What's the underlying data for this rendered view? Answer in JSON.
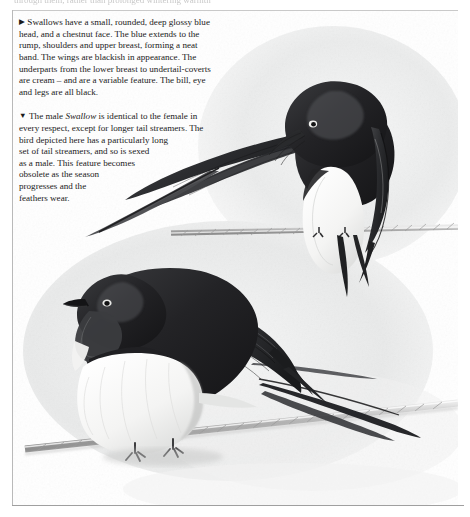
{
  "page": {
    "top_cut_text": "through them, rather than prolonged wintering warmth",
    "background_color": "#ffffff",
    "rule_color": "#b9b9b9"
  },
  "body_text": {
    "paragraph_1": {
      "marker": "▶",
      "marker_name": "triangle-right-marker",
      "lines": [
        "Swallows have a small, rounded, deep glossy blue",
        "head, and a chestnut face. The blue extends to the",
        "rump, shoulders and upper breast, forming a neat",
        "band. The wings are blackish in appearance. The",
        "underparts from the lower breast to undertail-coverts",
        "are cream – and are a variable feature. The bill, eye",
        "and legs are all black."
      ],
      "full_text": "Swallows have a small, rounded, deep glossy blue head, and a chestnut face. The blue extends to the rump, shoulders and upper breast, forming a neat band. The wings are blackish in appearance. The underparts from the lower breast to undertail-coverts are cream – and are a variable feature. The bill, eye and legs are all black."
    },
    "paragraph_2": {
      "marker": "▼",
      "marker_name": "triangle-down-marker",
      "lines": [
        "The male Swallow is identical to the female in",
        "every respect, except for longer tail streamers. The",
        "bird depicted here has a particularly long",
        "set of tail streamers, and so is sexed",
        "as a male. This feature becomes",
        "obsolete as the season",
        "progresses and the",
        "feathers wear."
      ],
      "italic_word": "Swallow",
      "full_text": "The male Swallow is identical to the female in every respect, except for longer tail streamers. The bird depicted here has a particularly long set of tail streamers, and so is sexed as a male. This feature becomes obsolete as the season progresses and the feathers wear."
    }
  },
  "illustration": {
    "name": "swallow-plate",
    "subject": "Barn Swallow (Hirundo rustica)",
    "medium": "monochrome watercolour / pencil field-guide plate",
    "birds": [
      {
        "name": "upper-swallow",
        "pose": "perched on wire, head turned down and toward viewer",
        "position": "upper right",
        "tail_streamers": "long, sweeping to the left across the text column"
      },
      {
        "name": "lower-swallow",
        "pose": "perched on diagonal wire, facing left, profile view",
        "position": "centre-left",
        "tail_streamers": "very long, sweeping to the lower right"
      }
    ],
    "wires": [
      {
        "name": "upper-wire",
        "description": "horizontal twisted cable beneath upper bird"
      },
      {
        "name": "lower-wire",
        "description": "diagonal twisted cable beneath lower bird"
      }
    ],
    "palette": {
      "plumage_dark": "#2b2b2d",
      "plumage_mid": "#6f7073",
      "underparts": "#fbfbfa",
      "wash_background": "#eceded",
      "wire": "#bcbcbc"
    }
  }
}
